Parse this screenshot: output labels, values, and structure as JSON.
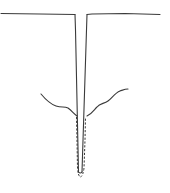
{
  "diagram": {
    "type": "line-art schematic",
    "colors": {
      "background": "#ffffff",
      "stroke": "#3a3a3a"
    },
    "elements": [
      {
        "name": "surface-line-left",
        "style": "solid"
      },
      {
        "name": "surface-line-right",
        "style": "solid"
      },
      {
        "name": "trench-walls",
        "style": "solid"
      },
      {
        "name": "wavy-profile-left",
        "style": "solid"
      },
      {
        "name": "wavy-profile-right",
        "style": "solid"
      },
      {
        "name": "dashed-inner-outline",
        "style": "dashed"
      }
    ]
  }
}
